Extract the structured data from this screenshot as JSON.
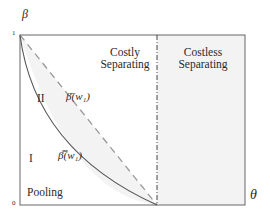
{
  "axes": {
    "y_label": "β",
    "x_label": "θ",
    "y_tick_top": "1",
    "y_tick_bottom": "0"
  },
  "regions": {
    "costly_separating": {
      "line1": "Costly",
      "line2": "Separating"
    },
    "costless_separating": {
      "line1": "Costless",
      "line2": "Separating"
    },
    "region_II": "II",
    "region_I": "I",
    "pooling": "Pooling"
  },
  "curves": {
    "dashed_curve_label": "β̄(w₁)",
    "solid_curve_label": "β̿(w₁)"
  },
  "colors": {
    "shade": "#f2f2f2",
    "line": "#555555",
    "dashed": "#9a9a9a"
  }
}
